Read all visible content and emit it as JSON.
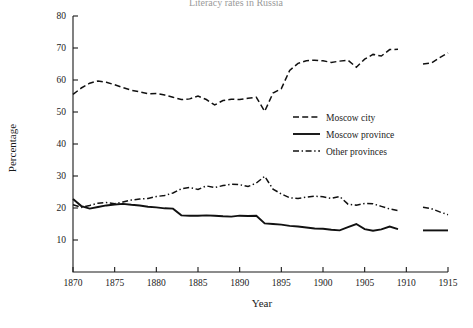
{
  "chart_data": {
    "type": "line",
    "title": "Literacy rates in Russia",
    "xlabel": "Year",
    "ylabel": "Percentage",
    "xlim": [
      1870,
      1915
    ],
    "ylim": [
      0,
      80
    ],
    "xticks": [
      1870,
      1875,
      1880,
      1885,
      1890,
      1895,
      1900,
      1905,
      1910,
      1915
    ],
    "yticks": [
      0,
      10,
      20,
      30,
      40,
      50,
      60,
      70,
      80
    ],
    "grid": false,
    "legend_position": "center-right",
    "series": [
      {
        "name": "Moscow city",
        "style": "dashed",
        "x": [
          1870,
          1871,
          1872,
          1873,
          1874,
          1875,
          1876,
          1877,
          1878,
          1879,
          1880,
          1881,
          1882,
          1883,
          1884,
          1885,
          1886,
          1887,
          1888,
          1889,
          1890,
          1891,
          1892,
          1893,
          1894,
          1895,
          1896,
          1897,
          1898,
          1899,
          1900,
          1901,
          1902,
          1903,
          1904,
          1905,
          1906,
          1907,
          1908,
          1909
        ],
        "values": [
          55.5,
          57.5,
          59.0,
          59.7,
          59.3,
          58.5,
          57.6,
          56.8,
          56.3,
          55.7,
          55.8,
          55.3,
          54.6,
          53.9,
          54.1,
          55.0,
          53.9,
          52.2,
          53.6,
          54.0,
          53.9,
          54.3,
          54.6,
          50.2,
          55.9,
          57.3,
          63.0,
          65.2,
          66.0,
          66.2,
          66.0,
          65.5,
          65.9,
          66.2,
          64.0,
          66.5,
          68.0,
          67.5,
          69.5,
          69.6
        ]
      },
      {
        "name": "Moscow city",
        "style": "dashed",
        "segment": "post-gap",
        "x": [
          1912,
          1913,
          1914,
          1915
        ],
        "values": [
          65.0,
          65.3,
          67.0,
          68.5
        ]
      },
      {
        "name": "Moscow province",
        "style": "solid",
        "x": [
          1870,
          1871,
          1872,
          1873,
          1874,
          1875,
          1876,
          1877,
          1878,
          1879,
          1880,
          1881,
          1882,
          1883,
          1884,
          1885,
          1886,
          1887,
          1888,
          1889,
          1890,
          1891,
          1892,
          1893,
          1894,
          1895,
          1896,
          1897,
          1898,
          1899,
          1900,
          1901,
          1902,
          1903,
          1904,
          1905,
          1906,
          1907,
          1908,
          1909
        ],
        "values": [
          22.8,
          20.6,
          19.8,
          20.3,
          20.8,
          21.1,
          21.3,
          21.0,
          20.8,
          20.4,
          20.2,
          19.9,
          19.8,
          17.7,
          17.6,
          17.6,
          17.7,
          17.6,
          17.4,
          17.3,
          17.6,
          17.5,
          17.6,
          15.2,
          15.0,
          14.8,
          14.4,
          14.2,
          13.9,
          13.6,
          13.5,
          13.2,
          13.0,
          14.0,
          15.0,
          13.4,
          12.9,
          13.3,
          14.2,
          13.4
        ]
      },
      {
        "name": "Moscow province",
        "style": "solid",
        "segment": "post-gap",
        "x": [
          1912,
          1913,
          1914,
          1915
        ],
        "values": [
          13.0,
          13.0,
          13.0,
          13.0
        ]
      },
      {
        "name": "Other provinces",
        "style": "dashdot",
        "x": [
          1870,
          1871,
          1872,
          1873,
          1874,
          1875,
          1876,
          1877,
          1878,
          1879,
          1880,
          1881,
          1882,
          1883,
          1884,
          1885,
          1886,
          1887,
          1888,
          1889,
          1890,
          1891,
          1892,
          1893,
          1894,
          1895,
          1896,
          1897,
          1898,
          1899,
          1900,
          1901,
          1902,
          1903,
          1904,
          1905,
          1906,
          1907,
          1908,
          1909
        ],
        "values": [
          21.0,
          20.2,
          20.8,
          21.5,
          21.7,
          21.3,
          21.9,
          22.5,
          22.8,
          23.0,
          23.6,
          23.9,
          24.7,
          26.0,
          26.4,
          25.8,
          26.9,
          26.4,
          27.0,
          27.4,
          27.3,
          26.7,
          27.8,
          29.9,
          25.9,
          24.4,
          23.2,
          23.0,
          23.4,
          23.7,
          23.5,
          23.0,
          23.6,
          21.2,
          20.9,
          21.4,
          21.3,
          20.5,
          19.7,
          19.2
        ]
      },
      {
        "name": "Other provinces",
        "style": "dashdot",
        "segment": "post-gap",
        "x": [
          1912,
          1913,
          1914,
          1915
        ],
        "values": [
          20.2,
          19.8,
          18.8,
          17.9
        ]
      }
    ]
  },
  "legend": {
    "items": [
      {
        "label": "Moscow city",
        "style": "dashed"
      },
      {
        "label": "Moscow province",
        "style": "solid"
      },
      {
        "label": "Other provinces",
        "style": "dashdot"
      }
    ]
  }
}
